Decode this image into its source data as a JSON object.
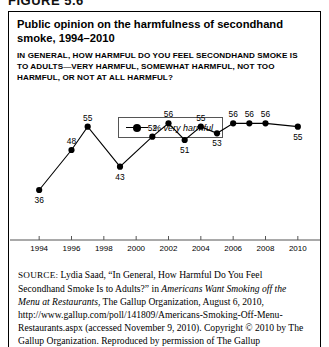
{
  "figure": {
    "number": "FIGURE 5.6",
    "title": "Public opinion on the harmfulness of secondhand smoke, 1994–2010",
    "question": "IN GENERAL, HOW HARMFUL DO YOU FEEL SECONDHAND SMOKE IS TO ADULTS—VERY HARMFUL, SOMEWHAT HARMFUL, NOT TOO HARMFUL, OR NOT AT ALL HARMFUL?"
  },
  "legend": {
    "position": "top-center",
    "entries": [
      {
        "label": "% very harmful",
        "marker": "line-with-filled-circle",
        "color": "#000000"
      }
    ]
  },
  "chart_data": {
    "type": "line",
    "title": "Public opinion on the harmfulness of secondhand smoke, 1994–2010",
    "xlabel": "",
    "ylabel": "",
    "grid": false,
    "legend_position": "top-center",
    "xlim": [
      1993,
      2011
    ],
    "ylim": [
      30,
      60
    ],
    "x_tick_labels": [
      "1994",
      "1996",
      "1998",
      "2000",
      "2002",
      "2004",
      "2006",
      "2008",
      "2010"
    ],
    "x_tick_values": [
      1994,
      1996,
      1998,
      2000,
      2002,
      2004,
      2006,
      2008,
      2010
    ],
    "y_axis_visible": false,
    "series": [
      {
        "name": "% very harmful",
        "color": "#000000",
        "x": [
          1994,
          1996,
          1997,
          1999,
          2001,
          2002,
          2003,
          2004,
          2005,
          2006,
          2007,
          2008,
          2010
        ],
        "values": [
          36,
          48,
          55,
          43,
          52,
          56,
          51,
          55,
          53,
          56,
          56,
          56,
          55
        ],
        "data_labels": [
          "36",
          "48",
          "55",
          "43",
          "52",
          "56",
          "51",
          "55",
          "53",
          "56",
          "56",
          "56",
          "55"
        ]
      }
    ]
  },
  "source": {
    "label": "SOURCE:",
    "text_part1": " Lydia Saad, “In General, How Harmful Do You Feel Secondhand Smoke Is to Adults?” in ",
    "italic1": "Americans Want Smoking off the Menu at Restaurants",
    "text_part2": ", The Gallup Organization, August 6, 2010, http://www.gallup.com/poll/141809/Americans-Smoking-Off-Menu-Restaurants.aspx (accessed November 9, 2010). Copyright © 2010 by The Gallup Organization. Reproduced by permission of The Gallup"
  }
}
